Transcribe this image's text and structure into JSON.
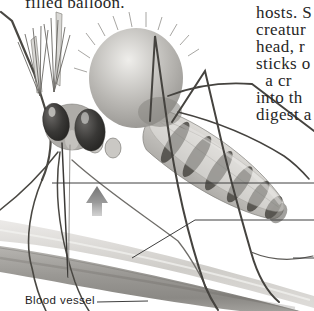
{
  "page": {
    "top_left_fragment": "filled balloon.",
    "paragraph": {
      "lines": [
        "hosts. S",
        "creatur",
        "head, r",
        "sticks o",
        "  a cr",
        "into th",
        "digest a"
      ]
    },
    "labels": {
      "blood_vessel": "Blood vessel"
    },
    "icons": {
      "up_arrow_icon": "▲"
    },
    "colors": {
      "background": "#ffffff",
      "text": "#262626",
      "leader_line": "#3e3e3e",
      "arrow_gray": "#8a8a8a",
      "vessel_light": "#cfcdc9",
      "vessel_dark": "#96948f",
      "mosquito_dark": "#2a2927"
    }
  }
}
